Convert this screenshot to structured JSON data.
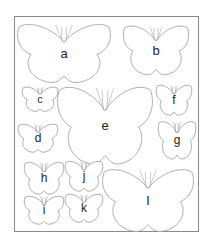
{
  "stroke_color": "#9a9a9a",
  "label_color": "#222222",
  "butterflies": [
    {
      "label": "a",
      "size": "large"
    },
    {
      "label": "b",
      "size": "medium"
    },
    {
      "label": "c",
      "size": "small"
    },
    {
      "label": "d",
      "size": "small"
    },
    {
      "label": "e",
      "size": "large"
    },
    {
      "label": "f",
      "size": "small"
    },
    {
      "label": "g",
      "size": "small"
    },
    {
      "label": "h",
      "size": "small"
    },
    {
      "label": "i",
      "size": "small"
    },
    {
      "label": "j",
      "size": "small"
    },
    {
      "label": "k",
      "size": "small"
    },
    {
      "label": "l",
      "size": "large"
    }
  ]
}
